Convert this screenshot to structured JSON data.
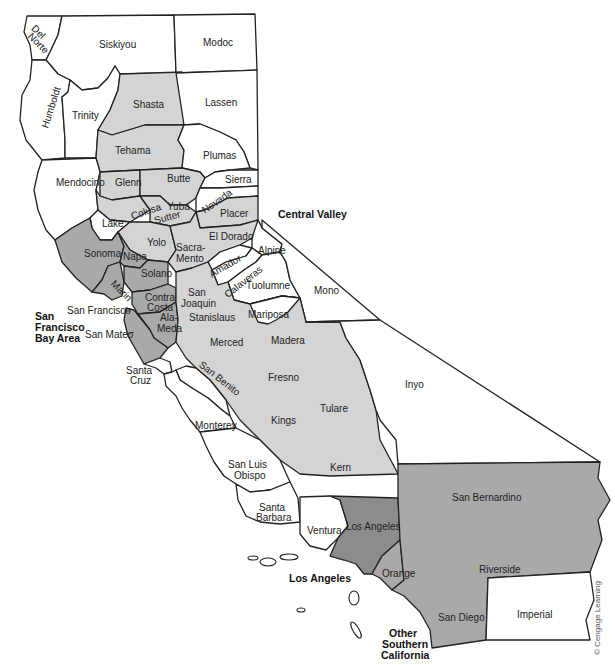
{
  "map": {
    "title": "California counties by region",
    "colors": {
      "other": "#ffffff",
      "central_valley": "#d4d4d4",
      "sf_bay_area": "#a9a9a9",
      "los_angeles": "#8c8c8c",
      "other_southern_california": "#a9a9a9"
    },
    "regions": {
      "central_valley": "Central Valley",
      "sf_bay_area_1": "San",
      "sf_bay_area_2": "Francisco",
      "sf_bay_area_3": "Bay Area",
      "los_angeles": "Los Angeles",
      "other_socal_1": "Other",
      "other_socal_2": "Southern",
      "other_socal_3": "California"
    },
    "counties": {
      "del_norte_1": "Del",
      "del_norte_2": "Norte",
      "siskiyou": "Siskiyou",
      "modoc": "Modoc",
      "humboldt": "Humboldt",
      "trinity": "Trinity",
      "shasta": "Shasta",
      "lassen": "Lassen",
      "tehama": "Tehama",
      "plumas": "Plumas",
      "mendocino": "Mendocino",
      "glenn": "Glenn",
      "butte": "Butte",
      "sierra": "Sierra",
      "nevada": "Nevada",
      "colusa": "Colusa",
      "yuba": "Yuba",
      "sutter": "Sutter",
      "placer": "Placer",
      "lake": "Lake",
      "yolo": "Yolo",
      "el_dorado": "El Dorado",
      "sacramento_1": "Sacra-",
      "sacramento_2": "Mento",
      "alpine": "Alpine",
      "sonoma": "Sonoma",
      "napa": "Napa",
      "amador": "Amador",
      "solano": "Solano",
      "calaveras": "Calaveras",
      "tuolumne": "Tuolumne",
      "mono": "Mono",
      "marin": "Marin",
      "contra_costa_1": "Contra",
      "contra_costa_2": "Costa",
      "san_joaquin_1": "San",
      "san_joaquin_2": "Joaquin",
      "san_francisco": "San Francisco",
      "alameda_1": "Ala-",
      "alameda_2": "Meda",
      "stanislaus": "Stanislaus",
      "mariposa": "Mariposa",
      "san_mateo": "San Mateo",
      "merced": "Merced",
      "madera": "Madera",
      "santa_cruz_1": "Santa",
      "santa_cruz_2": "Cruz",
      "san_benito": "San Benito",
      "fresno": "Fresno",
      "inyo": "Inyo",
      "tulare": "Tulare",
      "kings": "Kings",
      "monterey": "Monterey",
      "kern": "Kern",
      "san_luis_obispo_1": "San Luis",
      "san_luis_obispo_2": "Obispo",
      "san_bernardino": "San Bernardino",
      "santa_barbara_1": "Santa",
      "santa_barbara_2": "Barbara",
      "ventura": "Ventura",
      "los_angeles": "Los Angeles",
      "orange": "Orange",
      "riverside": "Riverside",
      "san_diego": "San Diego",
      "imperial": "Imperial"
    },
    "credit": "© Cengage Learning"
  }
}
